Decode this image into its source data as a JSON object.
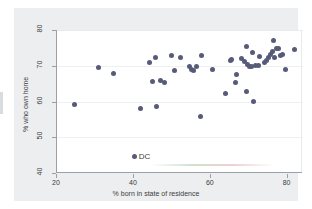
{
  "chart_data": {
    "type": "scatter",
    "title": "",
    "xlabel": "% born in state of residence",
    "ylabel": "% who own home",
    "xlim": [
      20,
      84
    ],
    "ylim": [
      40,
      80
    ],
    "xticks": [
      20,
      40,
      60,
      80
    ],
    "yticks": [
      40,
      50,
      60,
      70,
      80
    ],
    "grid": true,
    "legend": "none",
    "marker_color": "#575a78",
    "annotations": [
      {
        "label": "DC",
        "x": 39.7,
        "y": 44.5,
        "marker": true
      }
    ],
    "series": [
      {
        "name": "US states",
        "points": [
          [
            24.5,
            59.3
          ],
          [
            30.8,
            69.6
          ],
          [
            34.8,
            67.8
          ],
          [
            41.6,
            58.1
          ],
          [
            44.0,
            70.9
          ],
          [
            44.8,
            65.6
          ],
          [
            45.6,
            72.4
          ],
          [
            46.0,
            58.7
          ],
          [
            46.9,
            65.8
          ],
          [
            47.9,
            65.3
          ],
          [
            49.8,
            72.8
          ],
          [
            50.6,
            68.6
          ],
          [
            52.2,
            72.2
          ],
          [
            54.4,
            69.8
          ],
          [
            55.0,
            68.9
          ],
          [
            55.5,
            68.6
          ],
          [
            56.2,
            69.8
          ],
          [
            57.3,
            55.9
          ],
          [
            57.6,
            72.9
          ],
          [
            60.4,
            68.9
          ],
          [
            63.9,
            62.2
          ],
          [
            65.0,
            71.4
          ],
          [
            65.3,
            71.7
          ],
          [
            66.3,
            65.4
          ],
          [
            66.6,
            67.6
          ],
          [
            68.0,
            72.0
          ],
          [
            68.7,
            71.3
          ],
          [
            69.2,
            75.5
          ],
          [
            69.3,
            62.9
          ],
          [
            69.6,
            70.3
          ],
          [
            70.1,
            69.9
          ],
          [
            70.6,
            69.9
          ],
          [
            70.8,
            73.7
          ],
          [
            71.2,
            60.1
          ],
          [
            71.6,
            70.0
          ],
          [
            72.3,
            70.2
          ],
          [
            72.7,
            72.6
          ],
          [
            74.0,
            70.9
          ],
          [
            74.6,
            71.6
          ],
          [
            75.0,
            72.3
          ],
          [
            75.6,
            73.1
          ],
          [
            76.0,
            73.9
          ],
          [
            76.4,
            77.2
          ],
          [
            76.6,
            72.4
          ],
          [
            77.2,
            74.8
          ],
          [
            77.6,
            74.9
          ],
          [
            78.1,
            72.9
          ],
          [
            78.6,
            73.1
          ],
          [
            79.4,
            68.9
          ],
          [
            81.9,
            74.5
          ]
        ]
      }
    ]
  }
}
